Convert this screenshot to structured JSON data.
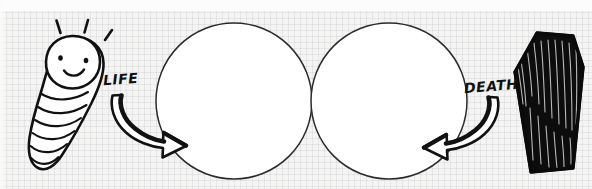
{
  "scene": {
    "title": "Life and death cycle doodle",
    "background_color": "#f4f4f2",
    "ink_color": "#111111",
    "paper": "graph-paper"
  },
  "labels": {
    "life": "LIFE",
    "death": "DEATH"
  },
  "figures": {
    "baby": {
      "name": "swaddled-baby",
      "expression": "smiling",
      "eyes": 2,
      "joy_lines": 3
    },
    "coffin": {
      "name": "coffin",
      "fill": "black-scribble"
    },
    "circles": [
      {
        "name": "empty-circle-left",
        "fill": "none"
      },
      {
        "name": "empty-circle-right",
        "fill": "none"
      }
    ],
    "arrows": [
      {
        "name": "life-arrow",
        "direction": "down-right"
      },
      {
        "name": "death-arrow",
        "direction": "down-left"
      }
    ]
  }
}
